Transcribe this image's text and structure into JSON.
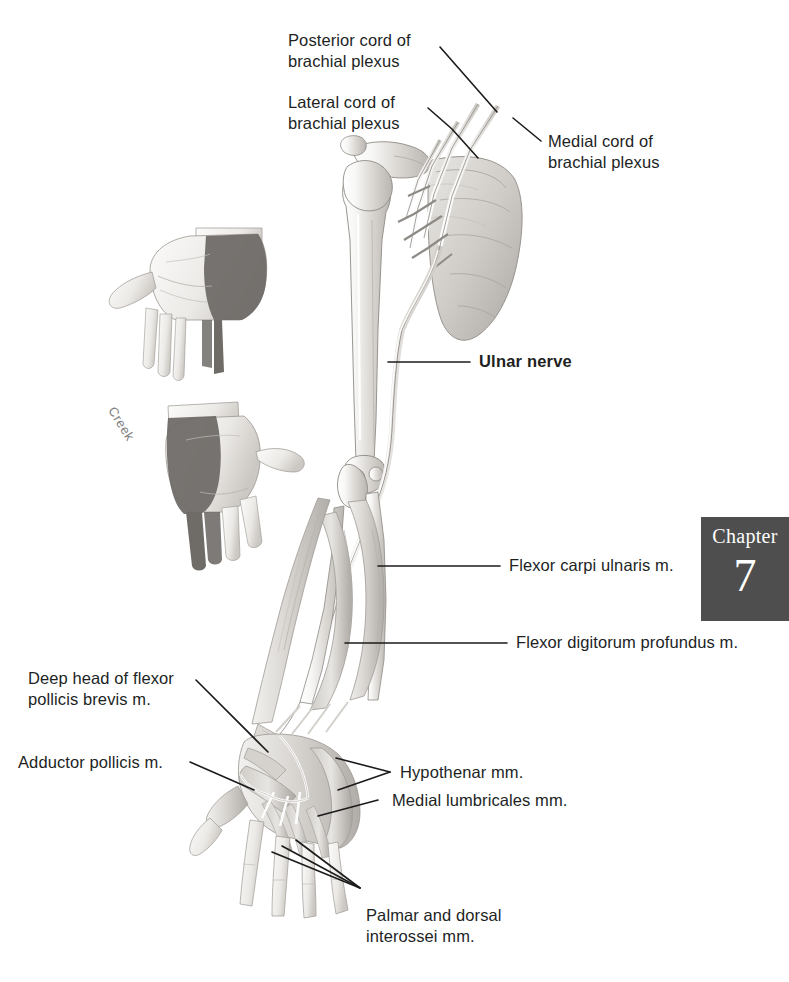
{
  "figure": {
    "background_color": "#ffffff",
    "ink_color": "#221f1f"
  },
  "chapter_tab": {
    "word": "Chapter",
    "number": "7",
    "background_color": "#4e4e4e",
    "text_color": "#ffffff"
  },
  "signature": {
    "text": "Creek"
  },
  "labels": [
    {
      "id": "posterior-cord",
      "text": "Posterior cord of\nbrachial plexus",
      "bold": false
    },
    {
      "id": "lateral-cord",
      "text": "Lateral cord of\nbrachial plexus",
      "bold": false
    },
    {
      "id": "medial-cord",
      "text": "Medial cord of\nbrachial plexus",
      "bold": false
    },
    {
      "id": "ulnar-nerve",
      "text": "Ulnar nerve",
      "bold": true
    },
    {
      "id": "fcu",
      "text": "Flexor carpi ulnaris m.",
      "bold": false
    },
    {
      "id": "fdp",
      "text": "Flexor digitorum profundus m.",
      "bold": false
    },
    {
      "id": "deep-head-fpb",
      "text": "Deep head of flexor\npollicis brevis m.",
      "bold": false
    },
    {
      "id": "adductor-pollicis",
      "text": "Adductor pollicis m.",
      "bold": false
    },
    {
      "id": "hypothenar",
      "text": "Hypothenar mm.",
      "bold": false
    },
    {
      "id": "medial-lumbricales",
      "text": "Medial lumbricales mm.",
      "bold": false
    },
    {
      "id": "interossei",
      "text": "Palmar and dorsal\ninterossei mm.",
      "bold": false
    }
  ],
  "insets": [
    {
      "id": "palmar-hand",
      "view": "palmar",
      "shading": "ulnar sensory distribution"
    },
    {
      "id": "dorsal-hand",
      "view": "dorsal",
      "shading": "ulnar sensory distribution"
    }
  ]
}
